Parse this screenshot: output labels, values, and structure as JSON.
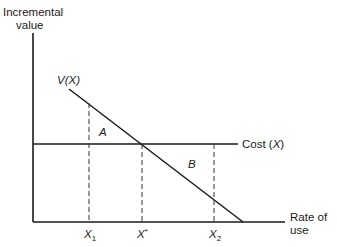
{
  "diagram": {
    "y_axis_label_line1": "Incremental",
    "y_axis_label_line2": "value",
    "x_axis_label_line1": "Rate of",
    "x_axis_label_line2": "use",
    "value_curve_label": "V(X)",
    "cost_line_label_prefix": "Cost (",
    "cost_line_label_var": "X",
    "cost_line_label_suffix": ")",
    "region_a_label": "A",
    "region_b_label": "B",
    "tick_x1": "X",
    "tick_x1_sub": "1",
    "tick_xstar": "X",
    "tick_xstar_sup": "*",
    "tick_x2": "X",
    "tick_x2_sub": "2",
    "colors": {
      "line": "#1a1a1a",
      "background": "#ffffff"
    }
  }
}
